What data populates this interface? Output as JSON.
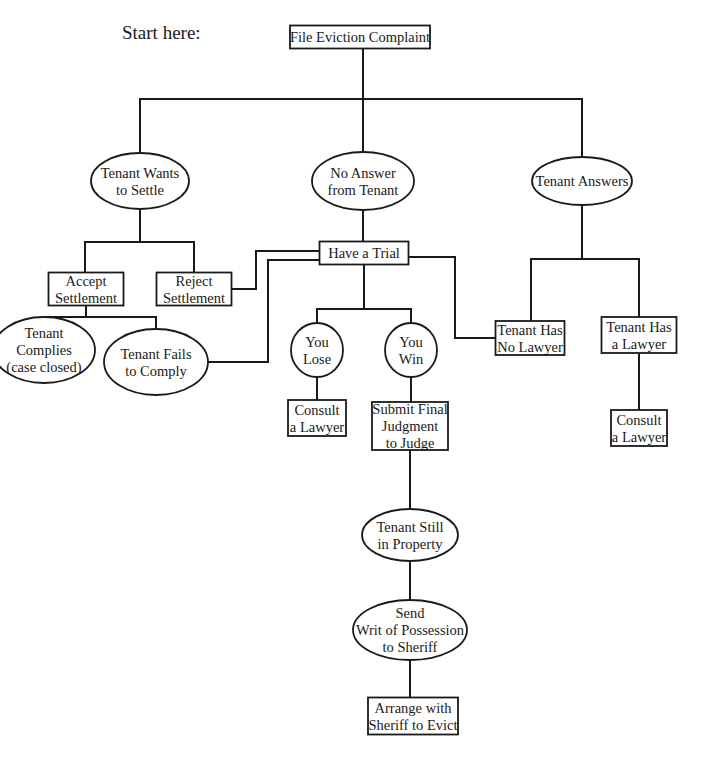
{
  "start_label": "Start here:",
  "colors": {
    "stroke": "#1a1a1a",
    "background": "#ffffff"
  },
  "nodes": [
    {
      "id": "file-eviction-complaint",
      "shape": "rect",
      "lines": [
        "File Eviction Complaint"
      ]
    },
    {
      "id": "tenant-wants-to-settle",
      "shape": "ellipse",
      "lines": [
        "Tenant Wants",
        "to Settle"
      ]
    },
    {
      "id": "no-answer-from-tenant",
      "shape": "ellipse",
      "lines": [
        "No Answer",
        "from Tenant"
      ]
    },
    {
      "id": "tenant-answers",
      "shape": "ellipse",
      "lines": [
        "Tenant Answers"
      ]
    },
    {
      "id": "accept-settlement",
      "shape": "rect",
      "lines": [
        "Accept",
        "Settlement"
      ]
    },
    {
      "id": "reject-settlement",
      "shape": "rect",
      "lines": [
        "Reject",
        "Settlement"
      ]
    },
    {
      "id": "have-a-trial",
      "shape": "rect",
      "lines": [
        "Have a Trial"
      ]
    },
    {
      "id": "tenant-complies",
      "shape": "ellipse",
      "lines": [
        "Tenant",
        "Complies",
        "(case closed)"
      ]
    },
    {
      "id": "tenant-fails-to-comply",
      "shape": "ellipse",
      "lines": [
        "Tenant Fails",
        "to Comply"
      ]
    },
    {
      "id": "you-lose",
      "shape": "ellipse",
      "lines": [
        "You",
        "Lose"
      ]
    },
    {
      "id": "you-win",
      "shape": "ellipse",
      "lines": [
        "You",
        "Win"
      ]
    },
    {
      "id": "tenant-has-no-lawyer",
      "shape": "rect",
      "lines": [
        "Tenant Has",
        "No Lawyer"
      ]
    },
    {
      "id": "tenant-has-a-lawyer",
      "shape": "rect",
      "lines": [
        "Tenant Has",
        "a Lawyer"
      ]
    },
    {
      "id": "consult-a-lawyer-lose",
      "shape": "rect",
      "lines": [
        "Consult",
        "a Lawyer"
      ]
    },
    {
      "id": "submit-final-judgment",
      "shape": "rect",
      "lines": [
        "Submit Final",
        "Judgment",
        "to Judge"
      ]
    },
    {
      "id": "consult-a-lawyer-has-lawyer",
      "shape": "rect",
      "lines": [
        "Consult",
        "a Lawyer"
      ]
    },
    {
      "id": "tenant-still-in-property",
      "shape": "ellipse",
      "lines": [
        "Tenant Still",
        "in Property"
      ]
    },
    {
      "id": "send-writ-of-possession",
      "shape": "ellipse",
      "lines": [
        "Send",
        "Writ of Possession",
        "to Sheriff"
      ]
    },
    {
      "id": "arrange-with-sheriff",
      "shape": "rect",
      "lines": [
        "Arrange with",
        "Sheriff to Evict"
      ]
    }
  ],
  "edges": [
    {
      "from": "file-eviction-complaint",
      "to": "tenant-wants-to-settle"
    },
    {
      "from": "file-eviction-complaint",
      "to": "no-answer-from-tenant"
    },
    {
      "from": "file-eviction-complaint",
      "to": "tenant-answers"
    },
    {
      "from": "tenant-wants-to-settle",
      "to": "accept-settlement"
    },
    {
      "from": "tenant-wants-to-settle",
      "to": "reject-settlement"
    },
    {
      "from": "no-answer-from-tenant",
      "to": "have-a-trial"
    },
    {
      "from": "reject-settlement",
      "to": "have-a-trial"
    },
    {
      "from": "accept-settlement",
      "to": "tenant-complies"
    },
    {
      "from": "accept-settlement",
      "to": "tenant-fails-to-comply"
    },
    {
      "from": "tenant-fails-to-comply",
      "to": "have-a-trial"
    },
    {
      "from": "have-a-trial",
      "to": "you-lose"
    },
    {
      "from": "have-a-trial",
      "to": "you-win"
    },
    {
      "from": "have-a-trial",
      "to": "tenant-has-no-lawyer"
    },
    {
      "from": "tenant-answers",
      "to": "tenant-has-no-lawyer"
    },
    {
      "from": "tenant-answers",
      "to": "tenant-has-a-lawyer"
    },
    {
      "from": "you-lose",
      "to": "consult-a-lawyer-lose"
    },
    {
      "from": "you-win",
      "to": "submit-final-judgment"
    },
    {
      "from": "tenant-has-a-lawyer",
      "to": "consult-a-lawyer-has-lawyer"
    },
    {
      "from": "submit-final-judgment",
      "to": "tenant-still-in-property"
    },
    {
      "from": "tenant-still-in-property",
      "to": "send-writ-of-possession"
    },
    {
      "from": "send-writ-of-possession",
      "to": "arrange-with-sheriff"
    }
  ]
}
